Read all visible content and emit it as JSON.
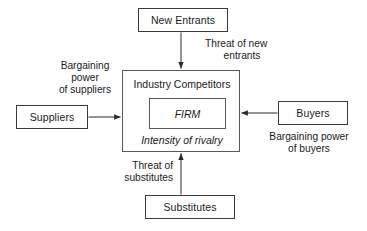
{
  "diagram": {
    "stroke_color": "#3b3b3b",
    "text_color": "#1a1a1a",
    "background_color": "#ffffff",
    "nodes": {
      "new_entrants": "New Entrants",
      "suppliers": "Suppliers",
      "buyers": "Buyers",
      "substitutes": "Substitutes",
      "industry_competitors": "Industry Competitors",
      "firm": "FIRM",
      "intensity_of_rivalry": "Intensity of rivalry"
    },
    "edge_labels": {
      "threat_of_new_entrants_line1": "Threat of new",
      "threat_of_new_entrants_line2": "entrants",
      "bargaining_power_of_suppliers_line1": "Bargaining",
      "bargaining_power_of_suppliers_line2": "power",
      "bargaining_power_of_suppliers_line3": "of suppliers",
      "bargaining_power_of_buyers_line1": "Bargaining power",
      "bargaining_power_of_buyers_line2": "of buyers",
      "threat_of_substitutes_line1": "Threat of",
      "threat_of_substitutes_line2": "substitutes"
    }
  }
}
